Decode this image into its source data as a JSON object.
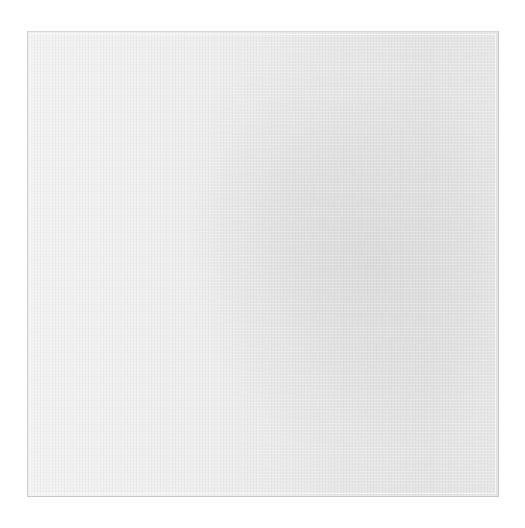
{
  "image": {
    "description": "Blank textured canvas / paper sheet on white background",
    "caption": "",
    "colors": {
      "background": "#ffffff",
      "panel_light": "#f1f1f1",
      "panel_mid": "#e8e8e8",
      "panel_dark": "#e3e3e3",
      "border": "#cfcfcf"
    }
  }
}
